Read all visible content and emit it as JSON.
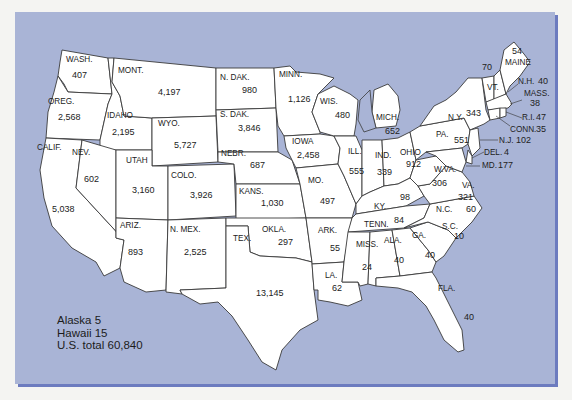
{
  "map": {
    "title": "",
    "colors": {
      "water": "#a9b4d6",
      "land": "#ffffff",
      "border": "#3a3a3a",
      "shadow": "#6c7bbf"
    },
    "states": [
      {
        "abbr": "WASH.",
        "value": "407"
      },
      {
        "abbr": "OREG.",
        "value": "2,568"
      },
      {
        "abbr": "CALIF.",
        "value": "5,038"
      },
      {
        "abbr": "IDAHO",
        "value": "2,195"
      },
      {
        "abbr": "NEV.",
        "value": "602"
      },
      {
        "abbr": "MONT.",
        "value": "4,197"
      },
      {
        "abbr": "WYO.",
        "value": "5,727"
      },
      {
        "abbr": "UTAH",
        "value": "3,160"
      },
      {
        "abbr": "ARIZ.",
        "value": "893"
      },
      {
        "abbr": "COLO.",
        "value": "3,926"
      },
      {
        "abbr": "N. MEX.",
        "value": "2,525"
      },
      {
        "abbr": "N. DAK.",
        "value": "980"
      },
      {
        "abbr": "S. DAK.",
        "value": "3,846"
      },
      {
        "abbr": "NEBR.",
        "value": "687"
      },
      {
        "abbr": "KANS.",
        "value": "1,030"
      },
      {
        "abbr": "OKLA.",
        "value": "297"
      },
      {
        "abbr": "TEX.",
        "value": "13,145"
      },
      {
        "abbr": "MINN.",
        "value": "1,126"
      },
      {
        "abbr": "IOWA",
        "value": "2,458"
      },
      {
        "abbr": "MO.",
        "value": "497"
      },
      {
        "abbr": "ARK.",
        "value": "55"
      },
      {
        "abbr": "LA.",
        "value": "62"
      },
      {
        "abbr": "WIS.",
        "value": "480"
      },
      {
        "abbr": "ILL.",
        "value": "555"
      },
      {
        "abbr": "MICH.",
        "value": "652"
      },
      {
        "abbr": "IND.",
        "value": "339"
      },
      {
        "abbr": "OHIO",
        "value": "912"
      },
      {
        "abbr": "KY.",
        "value": "98"
      },
      {
        "abbr": "TENN.",
        "value": "84"
      },
      {
        "abbr": "MISS.",
        "value": "24"
      },
      {
        "abbr": "ALA.",
        "value": "40"
      },
      {
        "abbr": "GA.",
        "value": "40"
      },
      {
        "abbr": "FLA.",
        "value": "40"
      },
      {
        "abbr": "S.C.",
        "value": "10"
      },
      {
        "abbr": "N.C.",
        "value": "60"
      },
      {
        "abbr": "VA.",
        "value": "321"
      },
      {
        "abbr": "W.VA.",
        "value": "306"
      },
      {
        "abbr": "PA.",
        "value": "551"
      },
      {
        "abbr": "N.Y.",
        "value": "343"
      },
      {
        "abbr": "VT.",
        "value": "70"
      },
      {
        "abbr": "MAINE",
        "value": "54"
      },
      {
        "abbr": "N.H.",
        "value": "40"
      },
      {
        "abbr": "MASS.",
        "value": "38"
      },
      {
        "abbr": "R.I.",
        "value": "47"
      },
      {
        "abbr": "CONN.",
        "value": "35"
      },
      {
        "abbr": "N.J.",
        "value": "102"
      },
      {
        "abbr": "DEL.",
        "value": "4"
      },
      {
        "abbr": "MD.",
        "value": "177"
      }
    ],
    "legend": {
      "alaska": "Alaska 5",
      "hawaii": "Hawaii 15",
      "total": "U.S. total 60,840"
    }
  }
}
